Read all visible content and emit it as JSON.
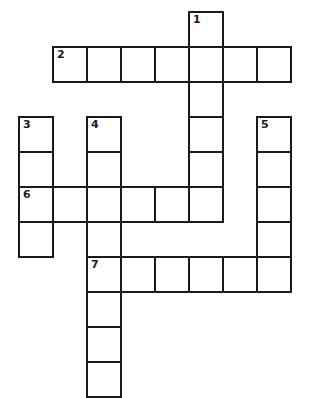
{
  "puzzle": {
    "type": "crossword",
    "layout": {
      "origin_x": 18,
      "origin_y": 11,
      "cell_w": 34,
      "cell_h": 35
    },
    "colors": {
      "line": "#1a1a1a",
      "cell_bg": "#ffffff"
    },
    "words": [
      {
        "number": "1",
        "direction": "down",
        "row": 0,
        "col": 5,
        "length": 6
      },
      {
        "number": "2",
        "direction": "across",
        "row": 1,
        "col": 1,
        "length": 7
      },
      {
        "number": "3",
        "direction": "down",
        "row": 3,
        "col": 0,
        "length": 4
      },
      {
        "number": "4",
        "direction": "down",
        "row": 3,
        "col": 2,
        "length": 8
      },
      {
        "number": "5",
        "direction": "down",
        "row": 3,
        "col": 7,
        "length": 5
      },
      {
        "number": "6",
        "direction": "across",
        "row": 5,
        "col": 0,
        "length": 6
      },
      {
        "number": "7",
        "direction": "across",
        "row": 7,
        "col": 2,
        "length": 6
      }
    ]
  }
}
